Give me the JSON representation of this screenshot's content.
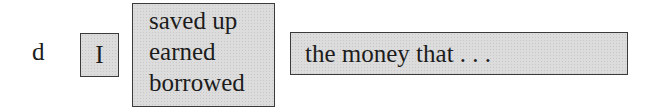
{
  "exercise": {
    "item_label": "d",
    "subject": "I",
    "verb_options": [
      "saved up",
      "earned",
      "borrowed"
    ],
    "object": "the money that . . ."
  },
  "colors": {
    "box_fill": "#dcdcdc",
    "box_border": "#3a3a3a",
    "text": "#1c1c1c"
  }
}
